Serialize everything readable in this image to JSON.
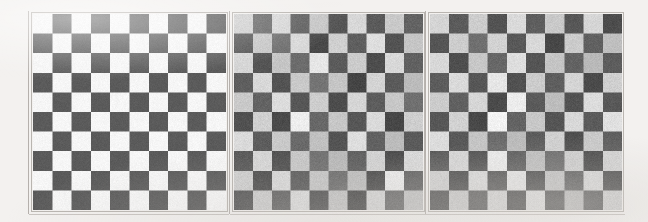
{
  "figure": {
    "background_color": "#f3f1ef",
    "width": 648,
    "height": 222,
    "panel_count": 3
  },
  "chart_data": {
    "type": "heatmap",
    "subtitle": "",
    "xlabel": "",
    "ylabel": "",
    "grid": false,
    "legend_position": "none",
    "colormap": "gray",
    "value_range": [
      0,
      255
    ],
    "rows": 10,
    "cols": 10,
    "panels": [
      {
        "index": 0,
        "name": "clean-checkerboard",
        "label": "",
        "noise_sigma": 0,
        "dark_value": 92,
        "light_value": 244,
        "dark_color": "#5c5c5c",
        "light_color": "#f4f3f1",
        "x": 33,
        "y": 14,
        "width": 193,
        "height": 196,
        "top_left_cell": "light",
        "values": [
          [
            244,
            92,
            244,
            92,
            244,
            92,
            244,
            92,
            244,
            92
          ],
          [
            92,
            244,
            92,
            244,
            92,
            244,
            92,
            244,
            92,
            244
          ],
          [
            244,
            92,
            244,
            92,
            244,
            92,
            244,
            92,
            244,
            92
          ],
          [
            92,
            244,
            92,
            244,
            92,
            244,
            92,
            244,
            92,
            244
          ],
          [
            244,
            92,
            244,
            92,
            244,
            92,
            244,
            92,
            244,
            92
          ],
          [
            92,
            244,
            92,
            244,
            92,
            244,
            92,
            244,
            92,
            244
          ],
          [
            244,
            92,
            244,
            92,
            244,
            92,
            244,
            92,
            244,
            92
          ],
          [
            92,
            244,
            92,
            244,
            92,
            244,
            92,
            244,
            92,
            244
          ],
          [
            244,
            92,
            244,
            92,
            244,
            92,
            244,
            92,
            244,
            92
          ],
          [
            92,
            244,
            92,
            244,
            92,
            244,
            92,
            244,
            92,
            244
          ]
        ]
      },
      {
        "index": 1,
        "name": "noisy-checkerboard-a",
        "label": "",
        "noise_sigma": 26,
        "dark_value": 96,
        "light_value": 206,
        "dark_color": "#606060",
        "light_color": "#cecece",
        "x": 234,
        "y": 14,
        "width": 189,
        "height": 196,
        "top_left_cell": "light",
        "values": [
          [
            206,
            104,
            212,
            96,
            198,
            86,
            214,
            92,
            200,
            100
          ],
          [
            88,
            198,
            110,
            214,
            74,
            206,
            96,
            220,
            84,
            196
          ],
          [
            212,
            86,
            196,
            108,
            228,
            92,
            202,
            78,
            214,
            98
          ],
          [
            96,
            214,
            84,
            200,
            116,
            196,
            70,
            210,
            92,
            186
          ],
          [
            200,
            100,
            218,
            88,
            204,
            78,
            212,
            94,
            198,
            112
          ],
          [
            82,
            206,
            76,
            236,
            104,
            198,
            88,
            216,
            72,
            204
          ],
          [
            216,
            94,
            200,
            106,
            192,
            84,
            220,
            98,
            186,
            92
          ],
          [
            90,
            212,
            82,
            198,
            112,
            184,
            96,
            208,
            78,
            214
          ],
          [
            204,
            78,
            214,
            92,
            196,
            110,
            188,
            74,
            232,
            96
          ],
          [
            86,
            202,
            98,
            216,
            84,
            194,
            72,
            210,
            104,
            192
          ]
        ]
      },
      {
        "index": 2,
        "name": "noisy-checkerboard-b",
        "label": "",
        "noise_sigma": 22,
        "dark_value": 94,
        "light_value": 208,
        "dark_color": "#5e5e5e",
        "light_color": "#d0d0d0",
        "x": 430,
        "y": 14,
        "width": 192,
        "height": 196,
        "top_left_cell": "light",
        "values": [
          [
            210,
            92,
            204,
            84,
            216,
            96,
            200,
            88,
            212,
            78
          ],
          [
            86,
            204,
            112,
            208,
            90,
            214,
            72,
            202,
            98,
            190
          ],
          [
            214,
            80,
            198,
            104,
            220,
            86,
            196,
            100,
            184,
            94
          ],
          [
            94,
            216,
            88,
            228,
            82,
            202,
            96,
            210,
            76,
            206
          ],
          [
            202,
            98,
            212,
            76,
            234,
            92,
            188,
            84,
            218,
            90
          ],
          [
            88,
            208,
            74,
            240,
            100,
            198,
            86,
            214,
            92,
            222
          ],
          [
            218,
            90,
            196,
            108,
            186,
            94,
            206,
            80,
            200,
            96
          ],
          [
            92,
            212,
            84,
            232,
            96,
            190,
            110,
            204,
            78,
            208
          ],
          [
            206,
            76,
            216,
            88,
            226,
            82,
            194,
            102,
            212,
            86
          ],
          [
            84,
            200,
            94,
            210,
            80,
            218,
            90,
            186,
            98,
            204
          ]
        ]
      }
    ]
  }
}
